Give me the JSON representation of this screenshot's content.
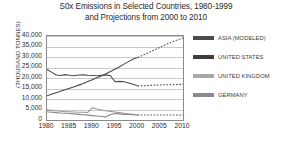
{
  "chart_data": {
    "type": "line",
    "title": "S0x Emissions in Selected Countries, 1980-1999 and Projections from 2000 to 2010",
    "title_line1": "S0x Emissions in Selected Countries, 1980-1999",
    "title_line2": "and Projections from 2000 to 2010",
    "xlabel": "",
    "ylabel": "(THOUSAND TONNES)",
    "xlim": [
      1980,
      2010
    ],
    "ylim": [
      0,
      40000
    ],
    "grid": true,
    "legend_position": "right",
    "x_ticks": [
      "1980",
      "1985",
      "1990",
      "1995",
      "2000",
      "2005",
      "2010"
    ],
    "x_tick_values": [
      1980,
      1985,
      1990,
      1995,
      2000,
      2005,
      2010
    ],
    "y_ticks": [
      "0",
      "5,000",
      "10,000",
      "15,000",
      "20,000",
      "25,000",
      "30,000",
      "35,000",
      "40,000"
    ],
    "y_tick_values": [
      0,
      5000,
      10000,
      15000,
      20000,
      25000,
      30000,
      35000,
      40000
    ],
    "x": [
      1980,
      1981,
      1982,
      1983,
      1984,
      1985,
      1986,
      1987,
      1988,
      1989,
      1990,
      1991,
      1992,
      1993,
      1994,
      1995,
      1996,
      1997,
      1998,
      1999,
      2000,
      2001,
      2002,
      2003,
      2004,
      2005,
      2006,
      2007,
      2008,
      2009,
      2010
    ],
    "projection_start_year": 2000,
    "series": [
      {
        "name": "ASIA (MODELED)",
        "color": "#4a4a4a",
        "solid_through": 2000,
        "values": [
          11500,
          12300,
          13000,
          13700,
          14400,
          15100,
          15800,
          16600,
          17400,
          18300,
          19200,
          20100,
          21000,
          22000,
          23100,
          24200,
          25400,
          26600,
          27800,
          29000,
          29800,
          30700,
          31700,
          32700,
          33700,
          34700,
          35700,
          36600,
          37500,
          38300,
          39000
        ]
      },
      {
        "name": "UNITED STATES",
        "color": "#4a4a4a",
        "solid_through": 2000,
        "values": [
          24000,
          22800,
          21400,
          21200,
          21600,
          21300,
          21100,
          21400,
          21500,
          21300,
          21200,
          21100,
          21300,
          21500,
          21100,
          18200,
          18400,
          18200,
          17600,
          17000,
          16200,
          16300,
          16400,
          16500,
          16600,
          16700,
          16800,
          16800,
          16900,
          16900,
          17000
        ]
      },
      {
        "name": "UNITED KINGDOM",
        "color": "#9a9a9a",
        "solid_through": 2000,
        "values": [
          4800,
          4600,
          4400,
          4200,
          4000,
          3900,
          3800,
          3700,
          3700,
          3600,
          5900,
          5200,
          4700,
          4400,
          4100,
          3800,
          3500,
          3200,
          2900,
          2700,
          2400,
          2400,
          2400,
          2400,
          2400,
          2400,
          2400,
          2400,
          2400,
          2400,
          2400
        ]
      },
      {
        "name": "GERMANY",
        "color": "#8a8a8a",
        "solid_through": 2000,
        "values": [
          3900,
          3700,
          3500,
          3300,
          3200,
          3100,
          2900,
          2700,
          2500,
          2300,
          2100,
          1900,
          1700,
          1500,
          2600,
          3100,
          2900,
          2700,
          2600,
          2500,
          2400,
          2400,
          2400,
          2400,
          2400,
          2400,
          2400,
          2400,
          2400,
          2400,
          2400
        ]
      }
    ]
  },
  "legend": {
    "items": [
      {
        "label": "ASIA (MODELED)",
        "color": "#4a4a4a"
      },
      {
        "label": "UNITED STATES",
        "color": "#3d3d3d"
      },
      {
        "label": "UNITED KINGDOM",
        "color": "#a8a8a8"
      },
      {
        "label": "GERMANY",
        "color": "#8a8a8a"
      }
    ]
  }
}
